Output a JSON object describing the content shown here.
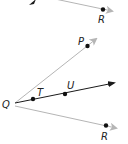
{
  "diagram": {
    "title": "",
    "colors": {
      "background": "#ffffff",
      "black_ray": "#1a1a1a",
      "gray_ray": "#b5b5b5",
      "point": "#111111",
      "label": "#222222"
    },
    "top_fragment": {
      "labels": {
        "R": "R"
      }
    },
    "bottom_figure": {
      "vertex": "Q",
      "labels": {
        "Q": "Q",
        "P": "P",
        "T": "T",
        "U": "U",
        "R": "R"
      },
      "rays": [
        {
          "name": "QP",
          "color": "gray"
        },
        {
          "name": "QU",
          "color": "black",
          "through": [
            "T",
            "U"
          ]
        },
        {
          "name": "QR",
          "color": "gray"
        }
      ]
    }
  }
}
